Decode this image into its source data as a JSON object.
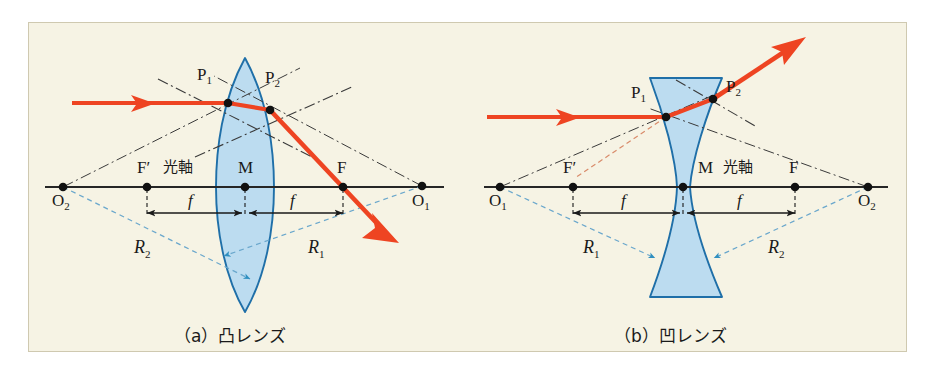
{
  "figure": {
    "background_color": "#f6f3e4",
    "frame_border_color": "#cfc9b0",
    "ray_color": "#ee4422",
    "lens_fill_color": "#bcdcf0",
    "lens_stroke_color": "#1f6fa8",
    "radius_line_color": "#5b9ec4",
    "normal_line_color": "#3a3a3a",
    "axis_color": "#262626",
    "text_color": "#1a1a1a"
  },
  "panels": [
    {
      "id": "convex",
      "caption": "（a）凸レンズ",
      "lens_type": "biconvex",
      "axis_label": "光軸",
      "labels": {
        "p1": "P",
        "p1_sub": "1",
        "p2": "P",
        "p2_sub": "2",
        "f_left": "F′",
        "f_right": "F",
        "center": "M",
        "o_left": "O",
        "o_left_sub": "2",
        "o_right": "O",
        "o_right_sub": "1",
        "focal_left": "f",
        "focal_right": "f",
        "radius_left": "R",
        "radius_left_sub": "2",
        "radius_right": "R",
        "radius_right_sub": "1"
      }
    },
    {
      "id": "concave",
      "caption": "（b）凹レンズ",
      "lens_type": "biconcave",
      "axis_label": "光軸",
      "labels": {
        "p1": "P",
        "p1_sub": "1",
        "p2": "P",
        "p2_sub": "2",
        "f_left": "F′",
        "f_right": "F",
        "center": "M",
        "o_left": "O",
        "o_left_sub": "1",
        "o_right": "O",
        "o_right_sub": "2",
        "focal_left": "f",
        "focal_right": "f",
        "radius_left": "R",
        "radius_left_sub": "1",
        "radius_right": "R",
        "radius_right_sub": "2"
      }
    }
  ]
}
